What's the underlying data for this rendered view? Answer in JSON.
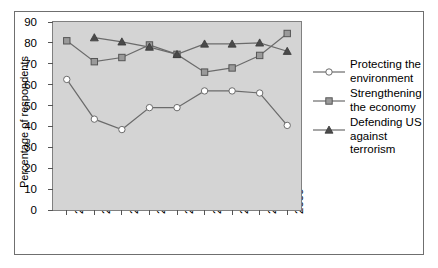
{
  "axes": {
    "ylabel": "Percentage of respondents",
    "yticks": [
      "0",
      "10",
      "20",
      "30",
      "40",
      "50",
      "60",
      "70",
      "80",
      "90"
    ],
    "xticks": [
      "2001",
      "2002",
      "2003",
      "2004",
      "2005",
      "2006",
      "2007",
      "2008",
      "2009"
    ]
  },
  "legend": {
    "items": [
      {
        "label": "Protecting the environment",
        "marker": "open-circle-marker",
        "color": "#7a7a7a"
      },
      {
        "label": "Strengthening the economy",
        "marker": "gray-square-marker",
        "color": "#808080"
      },
      {
        "label": "Defending US against terrorism",
        "marker": "dark-triangle-marker",
        "color": "#4a4a4a"
      }
    ]
  },
  "colors": {
    "plot_background": "#d4d4d4",
    "frame_border": "#6f6f6f",
    "line": "#6b6b6b",
    "marker_circle_fill": "#ffffff",
    "marker_square_fill": "#9a9a9a",
    "marker_triangle_fill": "#4a4a4a"
  },
  "chart_data": {
    "type": "line",
    "title": "",
    "xlabel": "",
    "ylabel": "Percentage of respondents",
    "categories": [
      "2001",
      "2002",
      "2003",
      "2004",
      "2005",
      "2006",
      "2007",
      "2008",
      "2009"
    ],
    "ylim": [
      0,
      90
    ],
    "ytick_step": 10,
    "grid": false,
    "legend_position": "right",
    "series": [
      {
        "name": "Protecting the environment",
        "marker": "open-circle",
        "values": [
          62.5,
          43.5,
          38.5,
          49,
          49,
          57,
          57,
          56,
          40.5
        ]
      },
      {
        "name": "Strengthening the economy",
        "marker": "gray-square",
        "values": [
          81,
          71,
          73,
          79,
          74.5,
          66,
          68,
          74,
          84.5
        ]
      },
      {
        "name": "Defending US against terrorism",
        "marker": "dark-triangle",
        "values": [
          null,
          82.5,
          80.5,
          78,
          74.5,
          79.5,
          79.5,
          80,
          76
        ]
      }
    ]
  }
}
